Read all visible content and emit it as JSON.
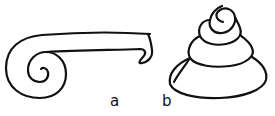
{
  "figure": {
    "panels": [
      {
        "id": "a",
        "label": "a",
        "description": "planispiral coil with extended straight uncoiled portion ending in a hook"
      },
      {
        "id": "b",
        "label": "b",
        "description": "conical trochospiral coil with stacked whorls"
      }
    ],
    "colors": {
      "stroke": "#111111",
      "background": "#ffffff"
    }
  }
}
